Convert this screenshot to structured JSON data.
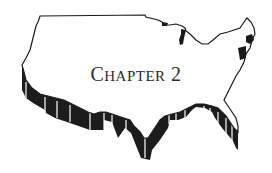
{
  "heading": {
    "first_letter": "C",
    "rest": "HAPTER",
    "number": "2"
  },
  "colors": {
    "outline": "#1a1a1a",
    "extrusion": "#1c1c1c",
    "background": "#ffffff",
    "text": "#2a2a2a"
  }
}
